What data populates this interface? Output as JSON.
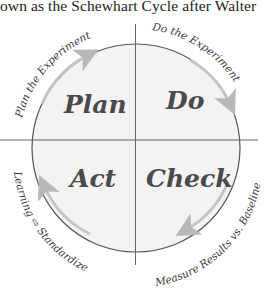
{
  "caption": "own as the Schewhart Cycle after Walter",
  "diagram": {
    "quadrants": [
      {
        "label": "Plan",
        "position": "top-left"
      },
      {
        "label": "Do",
        "position": "top-right"
      },
      {
        "label": "Act",
        "position": "bottom-left"
      },
      {
        "label": "Check",
        "position": "bottom-right"
      }
    ],
    "arc_labels": {
      "plan": "Plan the Experiment",
      "do": "Do the Experiment",
      "check": "Measure Results vs. Baseline",
      "act": "Learning ⇨ Standardize"
    },
    "colors": {
      "circle_fill": "#f3f3f3",
      "circle_stroke": "#555555",
      "axis_line": "#666666",
      "arrow": "#c4c4c4",
      "label_text": "#4a4a4a"
    }
  }
}
